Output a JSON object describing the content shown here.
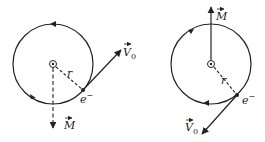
{
  "diagrams": [
    {
      "id": "left",
      "labels": {
        "radius": "r",
        "electron": "e",
        "electron_charge": "−",
        "velocity": "V",
        "velocity_sub": "0",
        "moment": "M"
      },
      "circle": {
        "cx": 53,
        "cy": 64,
        "r": 40
      },
      "orbit_direction": "counterclockwise",
      "moment_direction": "down (dashed)"
    },
    {
      "id": "right",
      "labels": {
        "radius": "r",
        "electron": "e",
        "electron_charge": "−",
        "velocity": "V",
        "velocity_sub": "0",
        "moment": "M"
      },
      "circle": {
        "cx": 211,
        "cy": 64,
        "r": 40
      },
      "orbit_direction": "clockwise",
      "moment_direction": "up (solid)"
    }
  ],
  "colors": {
    "stroke": "#222222",
    "background": "#ffffff"
  }
}
